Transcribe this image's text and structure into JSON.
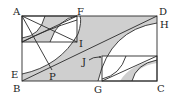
{
  "diagram": {
    "type": "geometry",
    "colors": {
      "stroke": "#2a2a2a",
      "shade": "#cfcfcf",
      "background": "#ffffff"
    },
    "labels": {
      "A": "A",
      "F": "F",
      "D": "D",
      "H": "H",
      "I": "I",
      "J": "J",
      "P": "P",
      "E": "E",
      "B": "B",
      "G": "G",
      "C": "C"
    }
  }
}
